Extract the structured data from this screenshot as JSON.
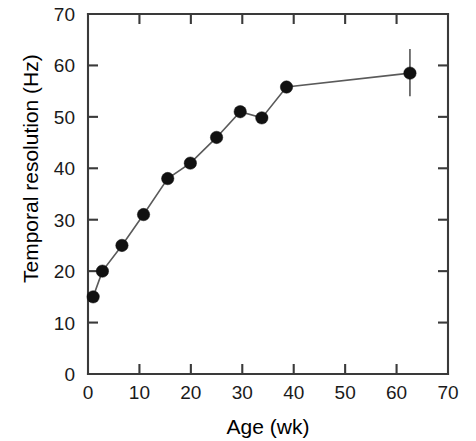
{
  "chart_data": {
    "type": "line",
    "title": "",
    "xlabel": "Age (wk)",
    "ylabel": "Temporal  resolution  (Hz)",
    "xlim": [
      0,
      70
    ],
    "ylim": [
      0,
      70
    ],
    "xticks": [
      0,
      10,
      20,
      30,
      40,
      50,
      60,
      70
    ],
    "xtick_labels": [
      "0",
      "10",
      "20",
      "30",
      "40",
      "50",
      "60",
      "70"
    ],
    "yticks": [
      0,
      10,
      20,
      30,
      40,
      50,
      60,
      70
    ],
    "ytick_labels": [
      "0",
      "10",
      "20",
      "30",
      "40",
      "50",
      "60",
      "70"
    ],
    "grid": false,
    "legend": "none",
    "x": [
      1.0,
      2.8,
      6.6,
      10.8,
      15.5,
      19.9,
      25.0,
      29.6,
      33.8,
      38.6,
      62.6
    ],
    "y": [
      15.0,
      20.0,
      25.0,
      31.0,
      38.0,
      41.0,
      46.0,
      51.0,
      49.8,
      55.8,
      58.5
    ],
    "error_bars": [
      {
        "x": 62.6,
        "y": 58.5,
        "lower": 54.0,
        "upper": 63.2
      }
    ],
    "marker": "filled-circle",
    "marker_color": "#111111",
    "line_color": "#5a5a5a"
  },
  "axes": {
    "x_title": "Age (wk)",
    "y_title": "Temporal  resolution  (Hz)"
  }
}
